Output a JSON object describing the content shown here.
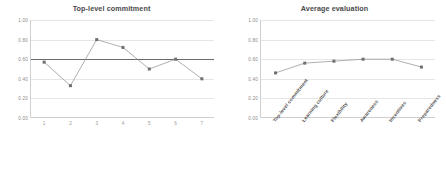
{
  "chart_data": [
    {
      "type": "line",
      "title": "Top-level commitment",
      "xlabel": "",
      "ylabel": "",
      "ylim": [
        0.0,
        1.0
      ],
      "yticks": [
        "0.00",
        "0.20",
        "0.40",
        "0.60",
        "0.80",
        "1.00"
      ],
      "ytick_values": [
        0.0,
        0.2,
        0.4,
        0.6,
        0.8,
        1.0
      ],
      "grid": true,
      "legend": "none",
      "categories": [
        "1",
        "2",
        "3",
        "4",
        "5",
        "6",
        "7"
      ],
      "values": [
        0.57,
        0.33,
        0.8,
        0.72,
        0.5,
        0.6,
        0.4
      ],
      "reference_line": {
        "value": 0.6,
        "label": ""
      }
    },
    {
      "type": "line",
      "title": "Average evaluation",
      "xlabel": "",
      "ylabel": "",
      "ylim": [
        0.0,
        1.0
      ],
      "yticks": [
        "0.00",
        "0.20",
        "0.40",
        "0.60",
        "0.80",
        "1.00"
      ],
      "ytick_values": [
        0.0,
        0.2,
        0.4,
        0.6,
        0.8,
        1.0
      ],
      "grid": true,
      "legend": "none",
      "categories": [
        "Top-level commitment",
        "Learning culture",
        "Flexibility",
        "Awareness",
        "Incentives",
        "Preparedness"
      ],
      "values": [
        0.46,
        0.56,
        0.58,
        0.6,
        0.6,
        0.52
      ]
    }
  ],
  "colors": {
    "line": "#8c8c8c",
    "marker": "#6f6f6f",
    "reference_line": "#6b6b6b",
    "grid": "#e6e6e6",
    "axis": "#cfcfcf",
    "title_text": "#4a4a4a",
    "tick_text": "#8a8a8a",
    "background": "#ffffff"
  }
}
